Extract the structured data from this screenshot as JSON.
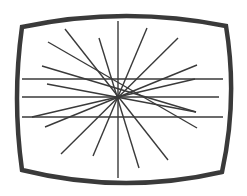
{
  "diagram": {
    "colors": {
      "background": "#ffffff",
      "frame": "#3a3a3a",
      "lines": "#3a3a3a"
    },
    "frame": {
      "corners": {
        "top_left": [
          22,
          27
        ],
        "top_right": [
          226,
          26
        ],
        "bottom_right": [
          222,
          172
        ],
        "bottom_left": [
          22,
          170
        ]
      },
      "top_mid_y": 16,
      "bottom_mid_y": 183,
      "left_mid_x": 17,
      "right_mid_x": 231,
      "stroke_width": 4.5
    },
    "center": [
      118,
      97
    ],
    "horizontal_lines": [
      {
        "y": 79,
        "x1": 22,
        "x2": 223
      },
      {
        "y": 97,
        "x1": 22,
        "x2": 219
      },
      {
        "y": 117,
        "x1": 22,
        "x2": 223
      }
    ],
    "radial_lines": [
      {
        "x1": 118,
        "y1": 21,
        "x2": 118,
        "y2": 178
      },
      {
        "x1": 65,
        "y1": 29,
        "x2": 168,
        "y2": 160
      },
      {
        "x1": 48,
        "y1": 42,
        "x2": 197,
        "y2": 128
      },
      {
        "x1": 99,
        "y1": 38,
        "x2": 139,
        "y2": 168
      },
      {
        "x1": 147,
        "y1": 28,
        "x2": 93,
        "y2": 156
      },
      {
        "x1": 178,
        "y1": 38,
        "x2": 61,
        "y2": 154
      },
      {
        "x1": 197,
        "y1": 65,
        "x2": 45,
        "y2": 127
      },
      {
        "x1": 42,
        "y1": 66,
        "x2": 196,
        "y2": 112
      },
      {
        "x1": 47,
        "y1": 84,
        "x2": 196,
        "y2": 112
      },
      {
        "x1": 195,
        "y1": 79,
        "x2": 32,
        "y2": 117
      }
    ],
    "line_width": 1.4
  }
}
